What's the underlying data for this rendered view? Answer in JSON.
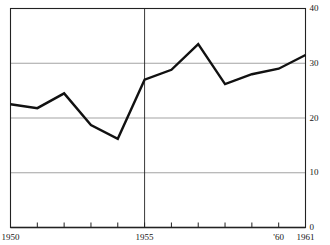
{
  "chart_data": {
    "type": "line",
    "title": "",
    "subtitle": "",
    "xlabel": "",
    "ylabel": "",
    "x": [
      1950,
      1951,
      1952,
      1953,
      1954,
      1955,
      1956,
      1957,
      1958,
      1959,
      1960,
      1961
    ],
    "values": [
      22.5,
      21.8,
      24.5,
      18.7,
      16.2,
      27.0,
      28.8,
      33.5,
      26.2,
      28.0,
      29.0,
      31.5
    ],
    "series": [
      {
        "name": "",
        "values": [
          22.5,
          21.8,
          24.5,
          18.7,
          16.2,
          27.0,
          28.8,
          33.5,
          26.2,
          28.0,
          29.0,
          31.5
        ]
      }
    ],
    "xlim": [
      1950,
      1961
    ],
    "ylim": [
      0,
      40
    ],
    "grid": true,
    "legend": false,
    "legend_position": "none",
    "y_ticks": [
      0,
      10,
      20,
      30,
      40
    ],
    "y_tick_labels": [
      "0",
      "10",
      "20",
      "30",
      "40"
    ],
    "y_axis_side": "right",
    "x_ticks": [
      1950,
      1951,
      1952,
      1953,
      1954,
      1955,
      1956,
      1957,
      1958,
      1959,
      1960,
      1961
    ],
    "x_tick_labels": [
      {
        "value": 1950,
        "label": "1950"
      },
      {
        "value": 1955,
        "label": "1955"
      },
      {
        "value": 1960,
        "label": "'60"
      },
      {
        "value": 1961,
        "label": "1961"
      }
    ],
    "annotations": [
      {
        "type": "vertical-rule",
        "value": 1955
      }
    ],
    "colors": {
      "line": "#111111",
      "grid": "#999999",
      "axis": "#222222",
      "background": "#ffffff",
      "text": "#161616"
    }
  }
}
